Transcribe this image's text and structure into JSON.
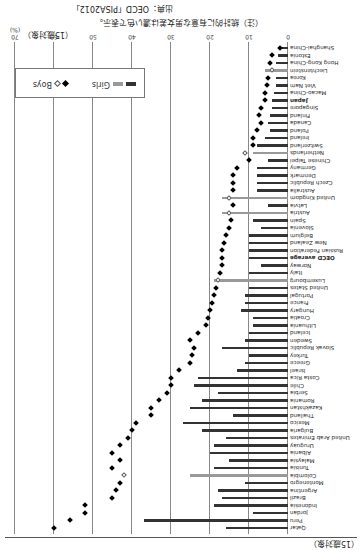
{
  "notes": {
    "subject": "（15歳対象）",
    "note": "（注）統計的に有意な男女差は濃い色で表示。",
    "source": "出典：OECD「PISA2012」"
  },
  "colors": {
    "girls_significant": "#333333",
    "girls_not_significant": "#999999",
    "boys_significant": "#000000",
    "boys_not_significant": "#ffffff"
  },
  "legend": {
    "girls": "Girls",
    "boys": "Boys"
  },
  "chart_data": {
    "type": "bar",
    "title": "",
    "xlabel": "(%)",
    "ylabel": "",
    "xlim": [
      0,
      70
    ],
    "ticks": [
      "0",
      "10",
      "20",
      "30",
      "40",
      "50",
      "60",
      "70"
    ],
    "unit_label": "(%)",
    "grid": true,
    "legend_position": "upper-right",
    "categories": [
      "Shanghai-China",
      "Estonia",
      "Hong Kong-China",
      "Liechtenstein",
      "Korea",
      "Viet Nam",
      "Macao-China",
      "Japan",
      "Singapore",
      "Finland",
      "Canada",
      "Poland",
      "Ireland",
      "Switzerland",
      "Netherlands",
      "Chinese Taipei",
      "Germany",
      "Denmark",
      "Czech Republic",
      "Australia",
      "United Kingdom",
      "Latvia",
      "Austria",
      "Spain",
      "Slovenia",
      "Belgium",
      "New Zealand",
      "Russian Federation",
      "OECD average",
      "Norway",
      "Italy",
      "Luxembourg",
      "United States",
      "Portugal",
      "France",
      "Hungary",
      "Croatia",
      "Lithuania",
      "Iceland",
      "Sweden",
      "Slovak Republic",
      "Turkey",
      "Greece",
      "Israel",
      "Costa Rica",
      "Chile",
      "Serbia",
      "Romania",
      "Kazakhstan",
      "Thailand",
      "Mexico",
      "Bulgaria",
      "United Arab Emirates",
      "Uruguay",
      "Albania",
      "Malaysia",
      "Tunisia",
      "Colombia",
      "Montenegro",
      "Argentina",
      "Brazil",
      "Indonesia",
      "Jordan",
      "Peru",
      "Qatar"
    ],
    "series": [
      {
        "name": "Girls",
        "values": [
          1.5,
          2.5,
          3,
          6,
          3,
          3,
          3.5,
          4,
          4,
          4.5,
          5,
          4.5,
          6,
          8,
          9,
          5,
          8,
          8,
          8,
          8,
          17,
          5,
          17,
          9,
          7,
          10,
          10,
          10,
          10,
          7,
          10,
          19,
          10,
          11,
          11,
          12,
          9,
          9,
          10,
          11,
          17,
          10,
          11,
          13,
          23,
          24,
          18,
          22,
          25,
          14,
          27,
          22,
          16,
          19,
          20,
          15,
          19,
          25,
          11,
          18,
          17,
          19,
          9,
          37,
          16
        ],
        "significant": [
          true,
          true,
          true,
          false,
          true,
          true,
          true,
          true,
          true,
          true,
          true,
          true,
          true,
          true,
          false,
          true,
          true,
          true,
          true,
          true,
          false,
          true,
          false,
          true,
          true,
          true,
          true,
          true,
          true,
          true,
          true,
          false,
          true,
          true,
          true,
          true,
          true,
          true,
          true,
          true,
          true,
          true,
          true,
          true,
          true,
          true,
          true,
          true,
          true,
          true,
          true,
          true,
          true,
          true,
          true,
          true,
          true,
          false,
          true,
          true,
          true,
          true,
          true,
          true,
          true
        ]
      },
      {
        "name": "Boys",
        "values": [
          2,
          4,
          4.5,
          4,
          5,
          5.5,
          6,
          6,
          7,
          7.5,
          7,
          8,
          9,
          9,
          11,
          10,
          13,
          14,
          14,
          14,
          15,
          14,
          15,
          14.5,
          15,
          16,
          16.5,
          17,
          17,
          17,
          17.5,
          18,
          18.5,
          19,
          19.5,
          20,
          20.5,
          21,
          23,
          25,
          24,
          24.5,
          25,
          28,
          30,
          30,
          31,
          33,
          35,
          35,
          39,
          40,
          41,
          43,
          45,
          43,
          45,
          42,
          43,
          44,
          45,
          52,
          52,
          56,
          60
        ],
        "significant": [
          true,
          true,
          true,
          false,
          true,
          true,
          true,
          true,
          true,
          true,
          true,
          true,
          true,
          true,
          false,
          true,
          true,
          true,
          true,
          true,
          false,
          true,
          false,
          true,
          true,
          true,
          true,
          true,
          true,
          true,
          true,
          false,
          true,
          true,
          true,
          true,
          true,
          true,
          true,
          true,
          true,
          true,
          true,
          true,
          true,
          true,
          true,
          true,
          true,
          true,
          true,
          true,
          true,
          true,
          true,
          true,
          true,
          false,
          true,
          true,
          true,
          true,
          true,
          true,
          true
        ]
      }
    ]
  }
}
